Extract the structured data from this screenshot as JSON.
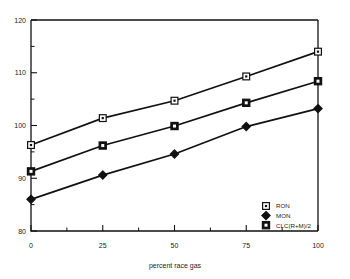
{
  "chart_data": {
    "type": "line",
    "title": "",
    "subtitle": "",
    "xlabel": "percent race gas",
    "ylabel": "",
    "x": [
      0,
      25,
      50,
      75,
      100
    ],
    "xlim": [
      0,
      100
    ],
    "ylim": [
      80,
      120
    ],
    "x_ticks": [
      0,
      25,
      50,
      75,
      100
    ],
    "x_tick_labels": [
      "0",
      "25",
      "50",
      "75",
      "100"
    ],
    "x_minor_ticks": [
      12.5,
      37.5,
      62.5,
      87.5
    ],
    "y_ticks": [
      80,
      90,
      100,
      110,
      120
    ],
    "y_tick_labels": [
      "80",
      "90",
      "100",
      "110",
      "120"
    ],
    "y_minor_ticks": [
      85,
      95,
      105,
      115
    ],
    "grid": false,
    "legend_position": "bottom-right",
    "series": [
      {
        "name": "RON",
        "marker": "open-square",
        "values": [
          96.3,
          101.4,
          104.7,
          109.3,
          114.0
        ]
      },
      {
        "name": "MON",
        "marker": "filled-diamond",
        "values": [
          86.0,
          90.6,
          94.6,
          99.8,
          103.2
        ]
      },
      {
        "name": "CLC(R+M)/2",
        "marker": "half-square",
        "values": [
          91.3,
          96.2,
          99.9,
          104.3,
          108.4
        ]
      }
    ]
  },
  "legend": {
    "entries": [
      {
        "label": "RON"
      },
      {
        "label": "MON"
      },
      {
        "label": "CLC(R+M)/2"
      }
    ]
  },
  "axes": {
    "x_label_text": "percent race gas"
  }
}
